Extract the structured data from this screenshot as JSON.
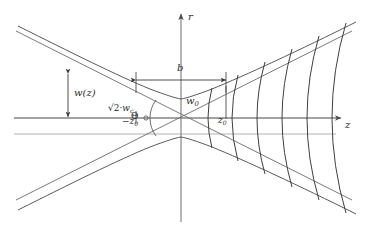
{
  "figure": {
    "type": "diagram",
    "width": 367,
    "height": 234,
    "background_color": "#ffffff",
    "stroke_color": "#3a3a3a",
    "light_stroke_color": "#9a9a9a",
    "text_color": "#2b2b2b"
  },
  "axes": {
    "vertical_label": "r",
    "horizontal_label": "z",
    "origin_x": 181,
    "origin_y": 118
  },
  "labels": {
    "beam_radius": "w(z)",
    "beam_radius_prefix": "",
    "sqrt_two_wc_radical": "√2",
    "sqrt_two_wc_operator": "·",
    "sqrt_two_wc_symbol": "w",
    "sqrt_two_wc_subscript": "c",
    "minus_z0_sign": "−",
    "minus_z0_symbol": "z",
    "minus_z0_subscript": "0",
    "theta": "Θ",
    "w0_symbol": "w",
    "w0_subscript": "0",
    "z0_symbol": "z",
    "z0_subscript": "0",
    "confocal_parameter": "b"
  },
  "elements": {
    "wavefronts_count": 6,
    "asymptote_lines": 2,
    "hyperbola_branches": 2,
    "horizontal_guides": 2,
    "dimension_arrows": 2
  },
  "colors": {
    "curve": "#555555",
    "axis": "#777777",
    "guide": "#aaaaaa",
    "wavefront": "#3f3f3f"
  }
}
